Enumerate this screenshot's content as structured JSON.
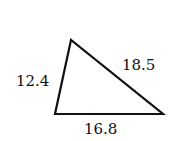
{
  "diagram": {
    "type": "triangle",
    "vertices": {
      "top": [
        71,
        40
      ],
      "bottom_left": [
        55,
        114
      ],
      "bottom_right": [
        163,
        114
      ]
    },
    "sides": [
      {
        "name": "left",
        "label": "12.4"
      },
      {
        "name": "right",
        "label": "18.5"
      },
      {
        "name": "bottom",
        "label": "16.8"
      }
    ],
    "stroke_color": "#111111"
  }
}
